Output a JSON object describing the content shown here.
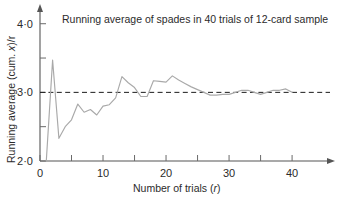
{
  "chart_data": {
    "type": "line",
    "title": "Running average of spades in 40 trials of 12-card sample",
    "xlabel": "Number of trials (r)",
    "ylabel": "Running average (cum. x)/r",
    "xlim": [
      0,
      43
    ],
    "ylim": [
      2.0,
      4.2
    ],
    "grid": false,
    "legend": "none",
    "x_ticks": [
      0,
      10,
      20,
      30,
      40
    ],
    "x_tick_labels": [
      "0",
      "10",
      "20",
      "30",
      "40"
    ],
    "x_minor_ticks": [
      5,
      15,
      25,
      35
    ],
    "y_ticks": [
      2.0,
      2.5,
      3.0,
      3.5,
      4.0
    ],
    "y_tick_labels": [
      "2·0",
      "",
      "3·0",
      "",
      "4·0"
    ],
    "reference_line": {
      "y": 3.0,
      "style": "dashed",
      "label": "expected value 3.0"
    },
    "series": [
      {
        "name": "Running average (cum. x)/r",
        "color": "#a9a9a9",
        "x": [
          1,
          2,
          3,
          4,
          5,
          6,
          7,
          8,
          9,
          10,
          11,
          12,
          13,
          14,
          15,
          16,
          17,
          18,
          19,
          20,
          21,
          22,
          23,
          24,
          25,
          26,
          27,
          28,
          29,
          30,
          31,
          32,
          33,
          34,
          35,
          36,
          37,
          38,
          39,
          40
        ],
        "values": [
          2.0,
          3.47,
          2.33,
          2.5,
          2.6,
          2.83,
          2.71,
          2.75,
          2.67,
          2.8,
          2.82,
          2.92,
          3.23,
          3.14,
          3.07,
          2.94,
          2.94,
          3.17,
          3.16,
          3.15,
          3.24,
          3.18,
          3.13,
          3.08,
          3.04,
          3.0,
          2.96,
          2.96,
          2.97,
          2.97,
          3.0,
          3.03,
          3.03,
          3.0,
          2.97,
          3.0,
          3.03,
          3.03,
          3.05,
          3.0
        ]
      }
    ]
  },
  "axis_label_parts": {
    "y_prefix": "Running average (cum. ",
    "y_var": "x",
    "y_suffix": ")/r",
    "x_prefix": "Number of trials (",
    "x_var": "r",
    "x_suffix": ")"
  }
}
